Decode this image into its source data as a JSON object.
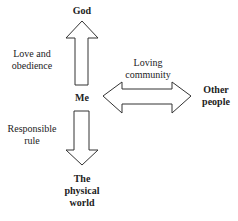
{
  "diagram": {
    "nodes": {
      "god": "God",
      "me": "Me",
      "other_people_line1": "Other",
      "other_people_line2": "people",
      "world_line1": "The",
      "world_line2": "physical",
      "world_line3": "world"
    },
    "edges": {
      "up_line1": "Love and",
      "up_line2": "obedience",
      "horizontal_line1": "Loving",
      "horizontal_line2": "community",
      "down_line1": "Responsible",
      "down_line2": "rule"
    },
    "colors": {
      "stroke": "#333333",
      "text": "#222222",
      "background": "#ffffff"
    }
  }
}
